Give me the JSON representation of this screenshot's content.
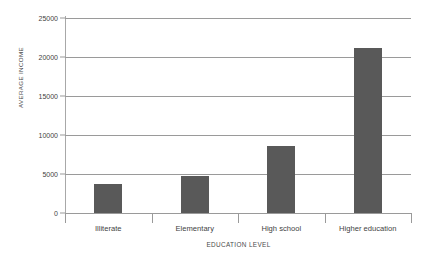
{
  "chart_data": {
    "type": "bar",
    "title": "",
    "subtitle": "",
    "xlabel": "EDUCATION LEVEL",
    "ylabel": "AVERAGE INCOME",
    "categories": [
      "Illiterate",
      "Elementary",
      "High school",
      "Higher education"
    ],
    "values": [
      3700,
      4750,
      8600,
      21150
    ],
    "series": [
      {
        "name": "Average income",
        "values": [
          3700,
          4750,
          8600,
          21150
        ]
      }
    ],
    "ylim": [
      0,
      25000
    ],
    "yticks": [
      0,
      5000,
      10000,
      15000,
      20000,
      25000
    ],
    "ytick_labels": [
      "0",
      "5000",
      "10000",
      "15000",
      "20000",
      "25000"
    ],
    "grid": "horizontal",
    "legend": "none",
    "bar_color": "#595959",
    "gridline_color": "#9a9a9a",
    "axis_color": "#9a9a9a",
    "background_color": "#ffffff",
    "annotations": []
  }
}
